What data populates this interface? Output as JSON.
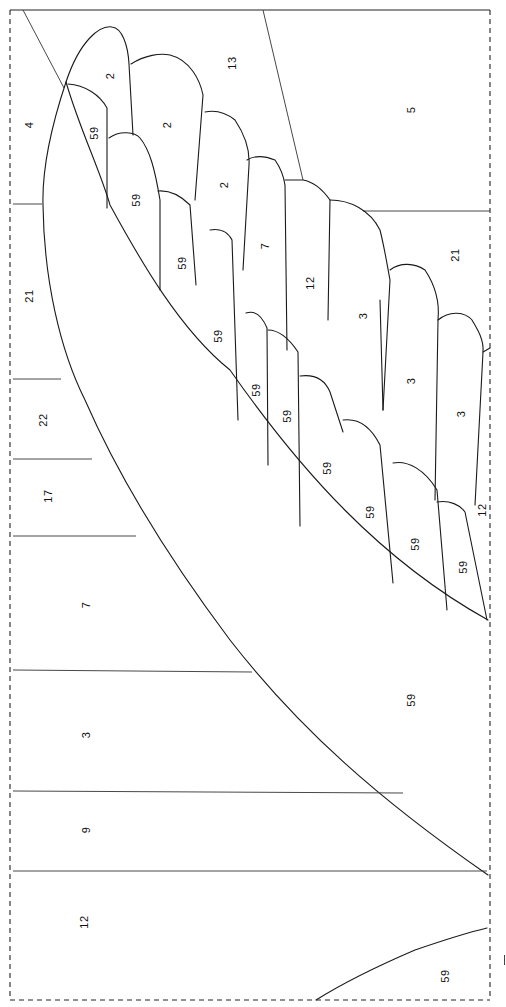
{
  "diagram": {
    "type": "pattern-piecing-template",
    "orientation": "rotated-90-ccw",
    "border": {
      "style": "dashed",
      "color": "#222222",
      "top_edge": "solid"
    },
    "line_color": "#1a1a1a",
    "background": "#ffffff"
  },
  "regions": [
    {
      "id": "r-4",
      "label": "4",
      "x": 29,
      "y": 125
    },
    {
      "id": "r-2a",
      "label": "2",
      "x": 110,
      "y": 76
    },
    {
      "id": "r-13",
      "label": "13",
      "x": 232,
      "y": 63
    },
    {
      "id": "r-5",
      "label": "5",
      "x": 411,
      "y": 110
    },
    {
      "id": "r-59a",
      "label": "59",
      "x": 94,
      "y": 133
    },
    {
      "id": "r-2b",
      "label": "2",
      "x": 167,
      "y": 125
    },
    {
      "id": "r-59b",
      "label": "59",
      "x": 136,
      "y": 200
    },
    {
      "id": "r-2c",
      "label": "2",
      "x": 224,
      "y": 185
    },
    {
      "id": "r-21a",
      "label": "21",
      "x": 29,
      "y": 296
    },
    {
      "id": "r-59c",
      "label": "59",
      "x": 182,
      "y": 263
    },
    {
      "id": "r-7a",
      "label": "7",
      "x": 265,
      "y": 246
    },
    {
      "id": "r-12a",
      "label": "12",
      "x": 310,
      "y": 283
    },
    {
      "id": "r-21b",
      "label": "21",
      "x": 455,
      "y": 255
    },
    {
      "id": "r-3a",
      "label": "3",
      "x": 363,
      "y": 316
    },
    {
      "id": "r-59d",
      "label": "59",
      "x": 218,
      "y": 336
    },
    {
      "id": "r-59e",
      "label": "59",
      "x": 256,
      "y": 390
    },
    {
      "id": "r-59f",
      "label": "59",
      "x": 287,
      "y": 416
    },
    {
      "id": "r-22",
      "label": "22",
      "x": 43,
      "y": 420
    },
    {
      "id": "r-3b",
      "label": "3",
      "x": 411,
      "y": 381
    },
    {
      "id": "r-3c",
      "label": "3",
      "x": 461,
      "y": 414
    },
    {
      "id": "r-59g",
      "label": "59",
      "x": 327,
      "y": 468
    },
    {
      "id": "r-17",
      "label": "17",
      "x": 48,
      "y": 496
    },
    {
      "id": "r-59h",
      "label": "59",
      "x": 370,
      "y": 512
    },
    {
      "id": "r-12b",
      "label": "12",
      "x": 482,
      "y": 510
    },
    {
      "id": "r-59i",
      "label": "59",
      "x": 415,
      "y": 544
    },
    {
      "id": "r-59j",
      "label": "59",
      "x": 463,
      "y": 567
    },
    {
      "id": "r-7b",
      "label": "7",
      "x": 86,
      "y": 605
    },
    {
      "id": "r-59k",
      "label": "59",
      "x": 411,
      "y": 700
    },
    {
      "id": "r-3d",
      "label": "3",
      "x": 86,
      "y": 735
    },
    {
      "id": "r-9",
      "label": "9",
      "x": 86,
      "y": 830
    },
    {
      "id": "r-12c",
      "label": "12",
      "x": 84,
      "y": 922
    },
    {
      "id": "r-59l",
      "label": "59",
      "x": 445,
      "y": 976
    }
  ],
  "margin_mark": {
    "label": "|",
    "x": 505,
    "y": 960
  }
}
